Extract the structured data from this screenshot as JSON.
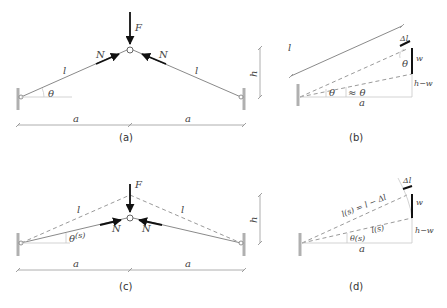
{
  "panels": {
    "a": {
      "caption": "(a)",
      "force_label": "F",
      "axial_left": "N",
      "axial_right": "N",
      "bar_left": "l",
      "bar_right": "l",
      "angle": "θ",
      "span_left": "a",
      "span_right": "a",
      "height_label": "h"
    },
    "b": {
      "caption": "(b)",
      "length_label": "l",
      "delta_l": "Δl",
      "angle_top": "θ",
      "angle_base": "θ",
      "angle_approx": "≈ θ",
      "w": "w",
      "h_minus_w": "h−w",
      "span": "a"
    },
    "c": {
      "caption": "(c)",
      "force_label": "F",
      "axial_left": "N",
      "axial_right": "N",
      "bar_left": "l",
      "bar_right": "l",
      "angle": "θ",
      "angle_sup": "(s)",
      "span_left": "a",
      "span_right": "a",
      "height_label": "h"
    },
    "d": {
      "caption": "(d)",
      "delta_l": "Δl",
      "length_upper": "l(s) = l − Δl",
      "length_lower": "l(s)",
      "angle": "θ(s)",
      "w": "w",
      "h_minus_w": "h−w",
      "span": "a"
    }
  }
}
